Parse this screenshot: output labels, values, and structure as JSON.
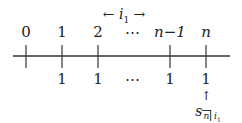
{
  "diagram": {
    "top_annotation": {
      "left_arrow": "←",
      "symbol": "i",
      "subscript": "1",
      "right_arrow": "→"
    },
    "time_labels": [
      "0",
      "1",
      "2",
      "⋯",
      "n−1",
      "n"
    ],
    "payment_labels": [
      "",
      "1",
      "1",
      "⋯",
      "1",
      "1"
    ],
    "accumulation_arrow": "↑",
    "accumulation_symbol": {
      "base": "s",
      "angle": "n",
      "rate": "i",
      "rate_subscript": "1"
    }
  }
}
